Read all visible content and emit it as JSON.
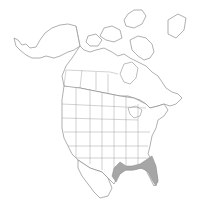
{
  "map": {
    "type": "range-map",
    "region": "North America",
    "shaded_region": "Southeastern United States (coastal plain, Texas to South Carolina)",
    "colors": {
      "background": "#ffffff",
      "outline": "#7a7a7a",
      "range_fill": "#a6a6a6"
    }
  }
}
